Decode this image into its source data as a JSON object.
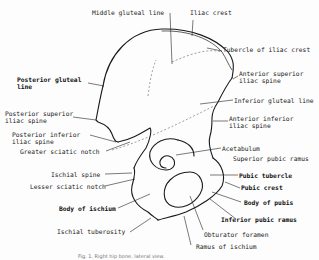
{
  "diagram": {
    "labels": {
      "middle_gluteal_line": "Middle gluteal line",
      "iliac_crest": "Iliac crest",
      "tubercle_iliac_crest": "Tubercle of iliac crest",
      "posterior_gluteal_line_1": "Posterior gluteal",
      "posterior_gluteal_line_2": "line",
      "anterior_superior_1": "Anterior superior",
      "anterior_superior_2": "iliac spine",
      "inferior_gluteal_line": "Inferior gluteal line",
      "posterior_superior_1": "Posterior superior",
      "posterior_superior_2": "iliac spine",
      "anterior_inferior_1": "Anterior inferior",
      "anterior_inferior_2": "iliac spine",
      "posterior_inferior_1": "Posterior inferior",
      "posterior_inferior_2": "iliac spine",
      "greater_sciatic_notch": "Greater sciatic notch",
      "acetabulum": "Acetabulum",
      "superior_pubic_ramus": "Superior pubic ramus",
      "ischial_spine": "Ischial spine",
      "pubic_tubercle": "Pubic tubercle",
      "pubic_crest": "Pubic crest",
      "lesser_sciatic_notch": "Lesser sciatic notch",
      "body_of_pubis": "Body of pubis",
      "body_of_ischium": "Body of ischium",
      "inferior_pubic_ramus": "Inferior pubic ramus",
      "obturator_foramen": "Obturator foramen",
      "ischial_tuberosity": "Ischial tuberosity",
      "ramus_of_ischium": "Ramus of ischium"
    },
    "caption": "Fig. 1. Right hip bone, lateral view."
  }
}
